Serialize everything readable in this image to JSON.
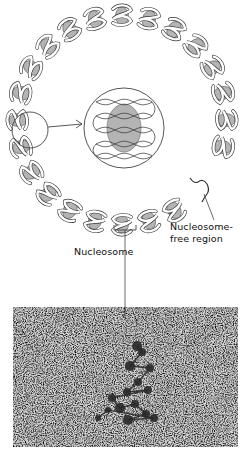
{
  "figure": {
    "type": "diagram",
    "labels": {
      "nucleosome_free_region_line1": "Nucleosome-",
      "nucleosome_free_region_line2": "free region",
      "nucleosome": "Nucleosome"
    },
    "ring": {
      "cx": 122,
      "cy": 120,
      "rx": 104,
      "ry": 104,
      "nucleosome_count": 24
    },
    "inset": {
      "cx": 124,
      "cy": 128,
      "r": 40
    },
    "callout_circle": {
      "cx": 30,
      "cy": 130,
      "r": 18
    },
    "micrograph": {
      "x": 13,
      "y": 307,
      "width": 225,
      "height": 140
    },
    "colors": {
      "histone_fill": "#b4b4b4",
      "dna_ribbon": "#ffffff",
      "stroke": "#333333",
      "micrograph_bg": "#cfcfcf",
      "micrograph_dark": "#2a2a2a"
    }
  }
}
